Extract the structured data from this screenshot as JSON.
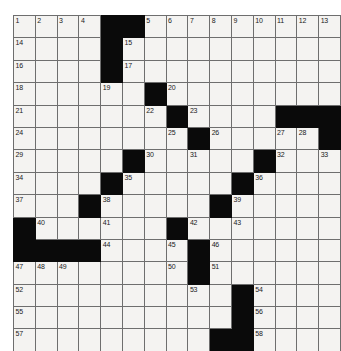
{
  "puzzle": {
    "type": "crossword-grid",
    "rows": 15,
    "cols": 15,
    "cell_fill_color": "#f4f3f1",
    "block_color": "#0a0a0a",
    "grid_line_color": "#6e6e6e",
    "page_background": "#ffffff",
    "highest_clue_number": 58,
    "grid": [
      [
        {
          "block": false,
          "num": "1"
        },
        {
          "block": false,
          "num": "2"
        },
        {
          "block": false,
          "num": "3"
        },
        {
          "block": false,
          "num": "4"
        },
        {
          "block": true,
          "num": ""
        },
        {
          "block": true,
          "num": ""
        },
        {
          "block": false,
          "num": "5"
        },
        {
          "block": false,
          "num": "6"
        },
        {
          "block": false,
          "num": "7"
        },
        {
          "block": false,
          "num": "8"
        },
        {
          "block": false,
          "num": "9"
        },
        {
          "block": false,
          "num": "10"
        },
        {
          "block": false,
          "num": "11"
        },
        {
          "block": false,
          "num": "12"
        },
        {
          "block": false,
          "num": "13"
        }
      ],
      [
        {
          "block": false,
          "num": "14"
        },
        {
          "block": false,
          "num": ""
        },
        {
          "block": false,
          "num": ""
        },
        {
          "block": false,
          "num": ""
        },
        {
          "block": true,
          "num": ""
        },
        {
          "block": false,
          "num": "15"
        },
        {
          "block": false,
          "num": ""
        },
        {
          "block": false,
          "num": ""
        },
        {
          "block": false,
          "num": ""
        },
        {
          "block": false,
          "num": ""
        },
        {
          "block": false,
          "num": ""
        },
        {
          "block": false,
          "num": ""
        },
        {
          "block": false,
          "num": ""
        },
        {
          "block": false,
          "num": ""
        },
        {
          "block": false,
          "num": ""
        }
      ],
      [
        {
          "block": false,
          "num": "16"
        },
        {
          "block": false,
          "num": ""
        },
        {
          "block": false,
          "num": ""
        },
        {
          "block": false,
          "num": ""
        },
        {
          "block": true,
          "num": ""
        },
        {
          "block": false,
          "num": "17"
        },
        {
          "block": false,
          "num": ""
        },
        {
          "block": false,
          "num": ""
        },
        {
          "block": false,
          "num": ""
        },
        {
          "block": false,
          "num": ""
        },
        {
          "block": false,
          "num": ""
        },
        {
          "block": false,
          "num": ""
        },
        {
          "block": false,
          "num": ""
        },
        {
          "block": false,
          "num": ""
        },
        {
          "block": false,
          "num": ""
        }
      ],
      [
        {
          "block": false,
          "num": "18"
        },
        {
          "block": false,
          "num": ""
        },
        {
          "block": false,
          "num": ""
        },
        {
          "block": false,
          "num": ""
        },
        {
          "block": false,
          "num": "19"
        },
        {
          "block": false,
          "num": ""
        },
        {
          "block": true,
          "num": ""
        },
        {
          "block": false,
          "num": "20"
        },
        {
          "block": false,
          "num": ""
        },
        {
          "block": false,
          "num": ""
        },
        {
          "block": false,
          "num": ""
        },
        {
          "block": false,
          "num": ""
        },
        {
          "block": false,
          "num": ""
        },
        {
          "block": false,
          "num": ""
        },
        {
          "block": false,
          "num": ""
        }
      ],
      [
        {
          "block": false,
          "num": "21"
        },
        {
          "block": false,
          "num": ""
        },
        {
          "block": false,
          "num": ""
        },
        {
          "block": false,
          "num": ""
        },
        {
          "block": false,
          "num": ""
        },
        {
          "block": false,
          "num": ""
        },
        {
          "block": false,
          "num": "22"
        },
        {
          "block": true,
          "num": ""
        },
        {
          "block": false,
          "num": "23"
        },
        {
          "block": false,
          "num": ""
        },
        {
          "block": false,
          "num": ""
        },
        {
          "block": false,
          "num": ""
        },
        {
          "block": true,
          "num": ""
        },
        {
          "block": true,
          "num": ""
        },
        {
          "block": true,
          "num": ""
        }
      ],
      [
        {
          "block": false,
          "num": "24"
        },
        {
          "block": false,
          "num": ""
        },
        {
          "block": false,
          "num": ""
        },
        {
          "block": false,
          "num": ""
        },
        {
          "block": false,
          "num": ""
        },
        {
          "block": false,
          "num": ""
        },
        {
          "block": false,
          "num": ""
        },
        {
          "block": false,
          "num": "25"
        },
        {
          "block": true,
          "num": ""
        },
        {
          "block": false,
          "num": "26"
        },
        {
          "block": false,
          "num": ""
        },
        {
          "block": false,
          "num": ""
        },
        {
          "block": false,
          "num": "27"
        },
        {
          "block": false,
          "num": "28"
        },
        {
          "block": true,
          "num": ""
        }
      ],
      [
        {
          "block": false,
          "num": "29"
        },
        {
          "block": false,
          "num": ""
        },
        {
          "block": false,
          "num": ""
        },
        {
          "block": false,
          "num": ""
        },
        {
          "block": false,
          "num": ""
        },
        {
          "block": true,
          "num": ""
        },
        {
          "block": false,
          "num": "30"
        },
        {
          "block": false,
          "num": ""
        },
        {
          "block": false,
          "num": "31"
        },
        {
          "block": false,
          "num": ""
        },
        {
          "block": false,
          "num": ""
        },
        {
          "block": true,
          "num": ""
        },
        {
          "block": false,
          "num": "32"
        },
        {
          "block": false,
          "num": ""
        },
        {
          "block": false,
          "num": "33"
        }
      ],
      [
        {
          "block": false,
          "num": "34"
        },
        {
          "block": false,
          "num": ""
        },
        {
          "block": false,
          "num": ""
        },
        {
          "block": false,
          "num": ""
        },
        {
          "block": true,
          "num": ""
        },
        {
          "block": false,
          "num": "35"
        },
        {
          "block": false,
          "num": ""
        },
        {
          "block": false,
          "num": ""
        },
        {
          "block": false,
          "num": ""
        },
        {
          "block": false,
          "num": ""
        },
        {
          "block": true,
          "num": ""
        },
        {
          "block": false,
          "num": "36"
        },
        {
          "block": false,
          "num": ""
        },
        {
          "block": false,
          "num": ""
        },
        {
          "block": false,
          "num": ""
        }
      ],
      [
        {
          "block": false,
          "num": "37"
        },
        {
          "block": false,
          "num": ""
        },
        {
          "block": false,
          "num": ""
        },
        {
          "block": true,
          "num": ""
        },
        {
          "block": false,
          "num": "38"
        },
        {
          "block": false,
          "num": ""
        },
        {
          "block": false,
          "num": ""
        },
        {
          "block": false,
          "num": ""
        },
        {
          "block": false,
          "num": ""
        },
        {
          "block": true,
          "num": ""
        },
        {
          "block": false,
          "num": "39"
        },
        {
          "block": false,
          "num": ""
        },
        {
          "block": false,
          "num": ""
        },
        {
          "block": false,
          "num": ""
        },
        {
          "block": false,
          "num": ""
        }
      ],
      [
        {
          "block": true,
          "num": ""
        },
        {
          "block": false,
          "num": "40"
        },
        {
          "block": false,
          "num": ""
        },
        {
          "block": false,
          "num": ""
        },
        {
          "block": false,
          "num": "41"
        },
        {
          "block": false,
          "num": ""
        },
        {
          "block": false,
          "num": ""
        },
        {
          "block": true,
          "num": ""
        },
        {
          "block": false,
          "num": "42"
        },
        {
          "block": false,
          "num": ""
        },
        {
          "block": false,
          "num": "43"
        },
        {
          "block": false,
          "num": ""
        },
        {
          "block": false,
          "num": ""
        },
        {
          "block": false,
          "num": ""
        },
        {
          "block": false,
          "num": ""
        }
      ],
      [
        {
          "block": true,
          "num": ""
        },
        {
          "block": true,
          "num": ""
        },
        {
          "block": true,
          "num": ""
        },
        {
          "block": true,
          "num": ""
        },
        {
          "block": false,
          "num": "44"
        },
        {
          "block": false,
          "num": ""
        },
        {
          "block": false,
          "num": ""
        },
        {
          "block": false,
          "num": "45"
        },
        {
          "block": true,
          "num": ""
        },
        {
          "block": false,
          "num": "46"
        },
        {
          "block": false,
          "num": ""
        },
        {
          "block": false,
          "num": ""
        },
        {
          "block": false,
          "num": ""
        },
        {
          "block": false,
          "num": ""
        },
        {
          "block": false,
          "num": ""
        }
      ],
      [
        {
          "block": false,
          "num": "47"
        },
        {
          "block": false,
          "num": "48"
        },
        {
          "block": false,
          "num": "49"
        },
        {
          "block": false,
          "num": ""
        },
        {
          "block": false,
          "num": ""
        },
        {
          "block": false,
          "num": ""
        },
        {
          "block": false,
          "num": ""
        },
        {
          "block": false,
          "num": "50"
        },
        {
          "block": true,
          "num": ""
        },
        {
          "block": false,
          "num": "51"
        },
        {
          "block": false,
          "num": ""
        },
        {
          "block": false,
          "num": ""
        },
        {
          "block": false,
          "num": ""
        },
        {
          "block": false,
          "num": ""
        },
        {
          "block": false,
          "num": ""
        }
      ],
      [
        {
          "block": false,
          "num": "52"
        },
        {
          "block": false,
          "num": ""
        },
        {
          "block": false,
          "num": ""
        },
        {
          "block": false,
          "num": ""
        },
        {
          "block": false,
          "num": ""
        },
        {
          "block": false,
          "num": ""
        },
        {
          "block": false,
          "num": ""
        },
        {
          "block": false,
          "num": ""
        },
        {
          "block": false,
          "num": "53"
        },
        {
          "block": false,
          "num": ""
        },
        {
          "block": true,
          "num": ""
        },
        {
          "block": false,
          "num": "54"
        },
        {
          "block": false,
          "num": ""
        },
        {
          "block": false,
          "num": ""
        },
        {
          "block": false,
          "num": ""
        }
      ],
      [
        {
          "block": false,
          "num": "55"
        },
        {
          "block": false,
          "num": ""
        },
        {
          "block": false,
          "num": ""
        },
        {
          "block": false,
          "num": ""
        },
        {
          "block": false,
          "num": ""
        },
        {
          "block": false,
          "num": ""
        },
        {
          "block": false,
          "num": ""
        },
        {
          "block": false,
          "num": ""
        },
        {
          "block": false,
          "num": ""
        },
        {
          "block": false,
          "num": ""
        },
        {
          "block": true,
          "num": ""
        },
        {
          "block": false,
          "num": "56"
        },
        {
          "block": false,
          "num": ""
        },
        {
          "block": false,
          "num": ""
        },
        {
          "block": false,
          "num": ""
        }
      ],
      [
        {
          "block": false,
          "num": "57"
        },
        {
          "block": false,
          "num": ""
        },
        {
          "block": false,
          "num": ""
        },
        {
          "block": false,
          "num": ""
        },
        {
          "block": false,
          "num": ""
        },
        {
          "block": false,
          "num": ""
        },
        {
          "block": false,
          "num": ""
        },
        {
          "block": false,
          "num": ""
        },
        {
          "block": false,
          "num": ""
        },
        {
          "block": true,
          "num": ""
        },
        {
          "block": true,
          "num": ""
        },
        {
          "block": false,
          "num": "58"
        },
        {
          "block": false,
          "num": ""
        },
        {
          "block": false,
          "num": ""
        },
        {
          "block": false,
          "num": ""
        }
      ]
    ]
  }
}
